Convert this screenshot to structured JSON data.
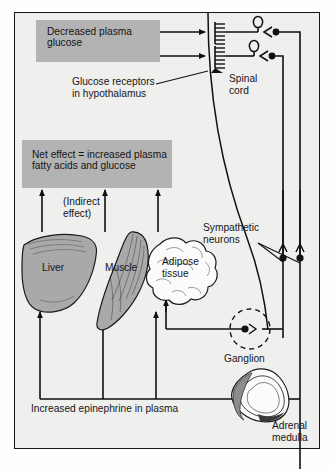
{
  "figure": {
    "background_color": "#efefed",
    "box_fill_color": "#b3b3b3",
    "line_color": "#111111"
  },
  "boxes": [
    {
      "id": "decreased-plasma-glucose",
      "text": "Decreased plasma\nglucose"
    },
    {
      "id": "net-effect",
      "text": "Net effect = increased plasma\nfatty acids and glucose"
    }
  ],
  "labels": {
    "glucose_receptors": "Glucose receptors\nin hypothalamus",
    "spinal_cord": "Spinal\ncord",
    "sympathetic_neurons": "Sympathetic\nneurons",
    "indirect_effect": "(Indirect\neffect)",
    "liver": "Liver",
    "muscle": "Muscle",
    "adipose_tissue": "Adipose\ntissue",
    "ganglion": "Ganglion",
    "adrenal_medulla": "Adrenal\nmedulla",
    "increased_epinephrine": "Increased epinephrine in plasma"
  },
  "diagram_elements": {
    "receptors": "comb-shaped glucose receptor endings in hypothalamus",
    "neurons": [
      "preganglionic sympathetic neuron to ganglion",
      "preganglionic sympathetic neuron to adrenal medulla"
    ],
    "targets": [
      "Liver",
      "Muscle",
      "Adipose tissue"
    ],
    "arrow_count_to_net_effect": 3
  }
}
